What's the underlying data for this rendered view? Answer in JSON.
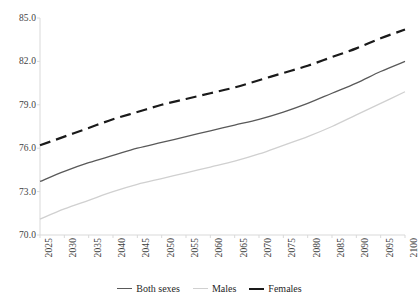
{
  "chart_data": {
    "type": "line",
    "title": "",
    "subtitle": "",
    "xlabel": "",
    "ylabel": "",
    "xlim": [
      2025,
      2100
    ],
    "ylim": [
      70.0,
      85.0
    ],
    "grid": false,
    "legend_position": "bottom-center",
    "x": [
      2025,
      2030,
      2035,
      2040,
      2045,
      2050,
      2055,
      2060,
      2065,
      2070,
      2075,
      2080,
      2085,
      2090,
      2095,
      2100
    ],
    "x_tick_labels": [
      "2025",
      "2030",
      "2035",
      "2040",
      "2045",
      "2050",
      "2055",
      "2060",
      "2065",
      "2070",
      "2075",
      "2080",
      "2085",
      "2090",
      "2095",
      "2100"
    ],
    "y_tick_labels": [
      "70.0",
      "73.0",
      "76.0",
      "79.0",
      "82.0",
      "85.0"
    ],
    "y_ticks": [
      70.0,
      73.0,
      76.0,
      79.0,
      82.0,
      85.0
    ],
    "series": [
      {
        "name": "Both sexes",
        "color": "#595959",
        "dash": "solid",
        "width": 1.3,
        "values": [
          73.7,
          74.4,
          75.0,
          75.5,
          76.0,
          76.4,
          76.8,
          77.2,
          77.6,
          78.0,
          78.5,
          79.1,
          79.8,
          80.5,
          81.3,
          82.0
        ]
      },
      {
        "name": "Males",
        "color": "#d0d0d0",
        "dash": "solid",
        "width": 1.3,
        "values": [
          71.1,
          71.8,
          72.4,
          73.0,
          73.5,
          73.9,
          74.3,
          74.7,
          75.1,
          75.6,
          76.2,
          76.8,
          77.5,
          78.3,
          79.1,
          79.9
        ]
      },
      {
        "name": "Females",
        "color": "#1a1a1a",
        "dash": "dashed",
        "width": 2.2,
        "values": [
          76.2,
          76.8,
          77.4,
          78.0,
          78.5,
          79.0,
          79.4,
          79.8,
          80.2,
          80.7,
          81.2,
          81.7,
          82.3,
          82.9,
          83.6,
          84.2
        ]
      }
    ]
  },
  "axes": {
    "y_labels": [
      {
        "text": "85.0",
        "value": 85.0
      },
      {
        "text": "82.0",
        "value": 82.0
      },
      {
        "text": "79.0",
        "value": 79.0
      },
      {
        "text": "76.0",
        "value": 76.0
      },
      {
        "text": "73.0",
        "value": 73.0
      },
      {
        "text": "70.0",
        "value": 70.0
      }
    ],
    "axis_line_color": "#d9d9d9"
  },
  "legend": {
    "items": [
      {
        "label": "Both sexes",
        "color": "#595959",
        "dash": "solid",
        "width": 1.3
      },
      {
        "label": "Males",
        "color": "#d0d0d0",
        "dash": "solid",
        "width": 1.3
      },
      {
        "label": "Females",
        "color": "#1a1a1a",
        "dash": "solid",
        "width": 2.2
      }
    ]
  }
}
